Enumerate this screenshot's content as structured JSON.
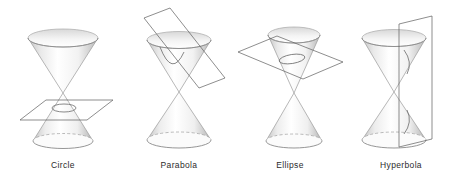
{
  "figure": {
    "background_color": "#ffffff",
    "width": 458,
    "height": 185,
    "label_color": "#2b2b2b",
    "cone_outline_color": "#8e8e8e",
    "cone_fill_light": "#ffffff",
    "cone_fill_shadow": "#c9c9c9",
    "plane_outline_color": "#5a5a5a",
    "intersection_color": "#555555",
    "hidden_edge_style": "dashed"
  },
  "panels": [
    {
      "id": "circle",
      "label": "Circle",
      "left": 6,
      "plane_orientation": "horizontal",
      "plane_name": "cutting-plane-horizontal",
      "cut_location": "lower-cone",
      "intersection_curve": "circle",
      "cone_name": "double-cone"
    },
    {
      "id": "parabola",
      "label": "Parabola",
      "left": 122,
      "plane_orientation": "tilted-parallel-to-slant",
      "plane_name": "cutting-plane-tilted",
      "cut_location": "upper-cone",
      "intersection_curve": "parabola",
      "cone_name": "double-cone"
    },
    {
      "id": "ellipse",
      "label": "Ellipse",
      "left": 233,
      "plane_orientation": "oblique",
      "plane_name": "cutting-plane-oblique",
      "cut_location": "upper-cone",
      "intersection_curve": "ellipse",
      "cone_name": "double-cone"
    },
    {
      "id": "hyperbola",
      "label": "Hyperbola",
      "left": 344,
      "plane_orientation": "vertical",
      "plane_name": "cutting-plane-vertical",
      "cut_location": "both-cones",
      "intersection_curve": "hyperbola",
      "cone_name": "double-cone"
    }
  ]
}
